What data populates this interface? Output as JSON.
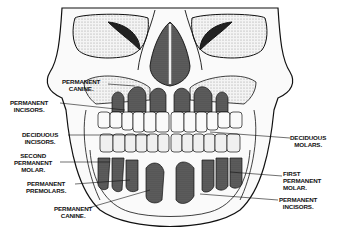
{
  "figure": {
    "colors": {
      "ink": "#111111",
      "bone": "#f2f2f2",
      "shade": "#555555",
      "background": "#ffffff"
    }
  },
  "labels": {
    "permanent_canine_upper": {
      "line1": "PERMANENT",
      "line2": "CANINE."
    },
    "permanent_incisors_left": {
      "line1": "PERMANENT",
      "line2": "INCISORS."
    },
    "deciduous_incisors": {
      "line1": "DECIDUOUS",
      "line2": "INCISORS."
    },
    "second_permanent_molar": {
      "line1": "SECOND",
      "line2": "PERMANENT",
      "line3": "MOLAR."
    },
    "permanent_premolars": {
      "line1": "PERMANENT",
      "line2": "PREMOLARS."
    },
    "permanent_canine_lower": {
      "line1": "PERMANENT",
      "line2": "CANINE."
    },
    "deciduous_molars": {
      "line1": "DECIDUOUS",
      "line2": "MOLARS."
    },
    "first_permanent_molar": {
      "line1": "FIRST",
      "line2": "PERMANENT",
      "line3": "MOLAR."
    },
    "permanent_incisors_right": {
      "line1": "PERMANENT",
      "line2": "INCISORS."
    }
  }
}
